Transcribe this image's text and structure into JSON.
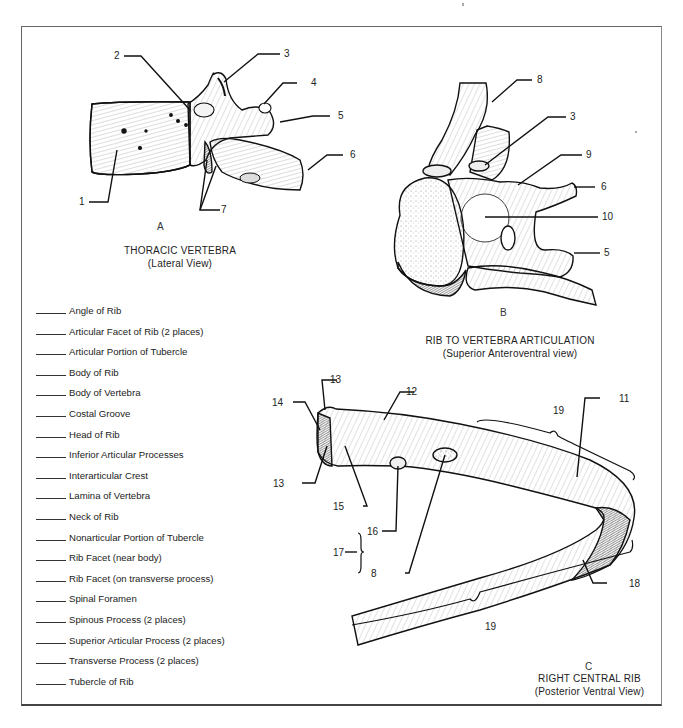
{
  "figures": {
    "A": {
      "letter": "A",
      "title": "THORACIC VERTEBRA",
      "subtitle": "(Lateral View)",
      "callouts": [
        "1",
        "2",
        "3",
        "4",
        "5",
        "6",
        "7"
      ]
    },
    "B": {
      "letter": "B",
      "title": "RIB TO VERTEBRA ARTICULATION",
      "subtitle": "(Superior Anteroventral view)",
      "callouts": [
        "8",
        "3",
        "9",
        "6",
        "10",
        "5"
      ]
    },
    "C": {
      "letter": "C",
      "title": "RIGHT CENTRAL RIB",
      "subtitle": "(Posterior Ventral View)",
      "callouts": [
        "13",
        "14",
        "12",
        "13",
        "15",
        "16",
        "17",
        "8",
        "19",
        "11",
        "18",
        "19"
      ]
    }
  },
  "word_bank": [
    "Angle of Rib",
    "Articular Facet of Rib (2 places)",
    "Articular Portion of Tubercle",
    "Body of Rib",
    "Body of Vertebra",
    "Costal Groove",
    "Head of Rib",
    "Inferior Articular Processes",
    "Interarticular Crest",
    "Lamina of Vertebra",
    "Neck of Rib",
    "Nonarticular Portion of Tubercle",
    "Rib Facet (near body)",
    "Rib Facet (on transverse process)",
    "Spinal Foramen",
    "Spinous Process (2 places)",
    "Superior Articular Process (2 places)",
    "Transverse Process (2 places)",
    "Tubercle of Rib"
  ],
  "colors": {
    "ink": "#1a1a1a",
    "paper": "#ffffff",
    "frame": "#555555"
  }
}
